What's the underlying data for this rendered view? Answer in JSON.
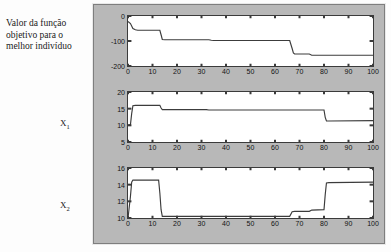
{
  "caption": {
    "text": "Valor da função objetivo para o melhor indivíduo"
  },
  "labels": {
    "x1": "X",
    "x1_sub": "1",
    "x2": "X",
    "x2_sub": "2"
  },
  "colors": {
    "panel_background": "#b8b8b8",
    "axes_background": "#ffffff",
    "axes_border": "#3b3b3b",
    "line": "#3c3c3c",
    "page_background": "#fdfdfd",
    "text": "#1a1a1a"
  },
  "chart_data": [
    {
      "type": "line",
      "title": "",
      "subtitle": "",
      "xlabel": "",
      "ylabel": "Valor da função objetivo para o melhor indivíduo",
      "xlim": [
        0,
        100
      ],
      "ylim": [
        -200,
        0
      ],
      "grid": false,
      "legend": null,
      "xticks": [
        0,
        10,
        20,
        30,
        40,
        50,
        60,
        70,
        80,
        90,
        100
      ],
      "yticks": [
        0,
        -100,
        -200
      ],
      "series": [
        {
          "name": "melhor individuo",
          "x": [
            0,
            1,
            2,
            3,
            4,
            13,
            13.5,
            14,
            15,
            33,
            34,
            35,
            66,
            67,
            67.5,
            68,
            74,
            75,
            76,
            100
          ],
          "values": [
            -22,
            -30,
            -50,
            -55,
            -57,
            -57,
            -75,
            -94,
            -95,
            -95,
            -97,
            -98,
            -98,
            -130,
            -148,
            -152,
            -152,
            -157,
            -157,
            -157
          ]
        }
      ]
    },
    {
      "type": "line",
      "title": "",
      "subtitle": "",
      "xlabel": "",
      "ylabel": "X1",
      "xlim": [
        0,
        100
      ],
      "ylim": [
        5,
        20
      ],
      "grid": false,
      "legend": null,
      "xticks": [
        0,
        10,
        20,
        30,
        40,
        50,
        60,
        70,
        80,
        90,
        100
      ],
      "yticks": [
        5,
        10,
        15,
        20
      ],
      "series": [
        {
          "name": "x1",
          "x": [
            0,
            1,
            1.5,
            2,
            3,
            13,
            13.5,
            14,
            15,
            32,
            33,
            34,
            80,
            80.5,
            81,
            82,
            100
          ],
          "values": [
            10.1,
            10.2,
            13.5,
            15.9,
            16.0,
            16.0,
            15.2,
            14.7,
            14.7,
            14.7,
            14.6,
            14.6,
            14.6,
            12.4,
            11.3,
            11.3,
            11.4
          ]
        }
      ]
    },
    {
      "type": "line",
      "title": "",
      "subtitle": "",
      "xlabel": "",
      "ylabel": "X2",
      "xlim": [
        0,
        100
      ],
      "ylim": [
        10,
        16
      ],
      "grid": false,
      "legend": null,
      "xticks": [
        0,
        10,
        20,
        30,
        40,
        50,
        60,
        70,
        80,
        90,
        100
      ],
      "yticks": [
        10,
        12,
        14,
        16
      ],
      "series": [
        {
          "name": "x2",
          "x": [
            0,
            1,
            1.5,
            2,
            12.5,
            13,
            13.5,
            14,
            15,
            66,
            67,
            68,
            74,
            75,
            80,
            80.5,
            81,
            82,
            100
          ],
          "values": [
            10.0,
            12.6,
            14.3,
            14.55,
            14.55,
            13.0,
            11.0,
            10.2,
            10.2,
            10.2,
            10.75,
            10.8,
            10.8,
            10.95,
            11.0,
            12.8,
            14.2,
            14.25,
            14.3
          ]
        }
      ]
    }
  ]
}
